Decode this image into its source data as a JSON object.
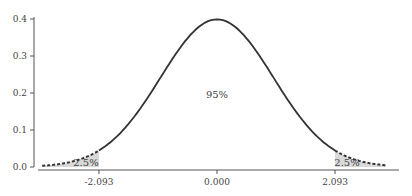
{
  "chart_data": {
    "type": "area",
    "title": "",
    "xlabel": "",
    "ylabel": "",
    "distribution": "standard normal density",
    "x_range": [
      -3.1,
      3.0
    ],
    "xlim": [
      -3.3,
      3.2
    ],
    "ylim": [
      0.0,
      0.4
    ],
    "yticks": [
      0.0,
      0.1,
      0.2,
      0.3,
      0.4
    ],
    "ytick_labels": [
      "0.0",
      "0.1",
      "0.2",
      "0.3",
      "0.4"
    ],
    "xticks": [
      -2.093,
      0.0,
      2.093
    ],
    "xtick_labels": [
      "-2.093",
      "0.000",
      "2.093"
    ],
    "critical_values": [
      -2.093,
      2.093
    ],
    "peak_density": 0.399,
    "regions": [
      {
        "name": "left-tail",
        "from": -3.1,
        "to": -2.093,
        "label": "2.5%",
        "shaded": true,
        "line": "dashed"
      },
      {
        "name": "center",
        "from": -2.093,
        "to": 2.093,
        "label": "95%",
        "shaded": false,
        "line": "solid"
      },
      {
        "name": "right-tail",
        "from": 2.093,
        "to": 3.0,
        "label": "2.5%",
        "shaded": true,
        "line": "dashed"
      }
    ],
    "grid": false,
    "legend": "none",
    "colors": {
      "curve": "#333333",
      "shade": "#d9d9d9",
      "axis": "#555555",
      "text": "#444444"
    }
  }
}
